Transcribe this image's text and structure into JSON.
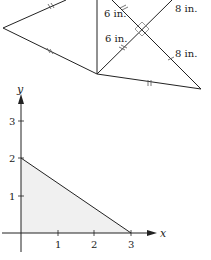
{
  "figure_top": {
    "type": "kite-with-diagonals",
    "labels": {
      "upper_left_segment": "6 in.",
      "lower_left_segment": "6 in.",
      "upper_right_segment": "8 in.",
      "lower_right_segment": "8 in."
    },
    "right_angle_marker": true,
    "congruence_ticks": "double"
  },
  "graph": {
    "x_axis_label": "x",
    "y_axis_label": "y",
    "x_ticks": [
      "1",
      "2",
      "3"
    ],
    "y_ticks": [
      "1",
      "2",
      "3"
    ],
    "shaded_region": "triangle with vertices (0,0), (3,0), (0,2)",
    "line": {
      "from": [
        0,
        2
      ],
      "to": [
        3,
        0
      ]
    },
    "fill_color": "#f0f0f0",
    "line_color": "#222222"
  }
}
